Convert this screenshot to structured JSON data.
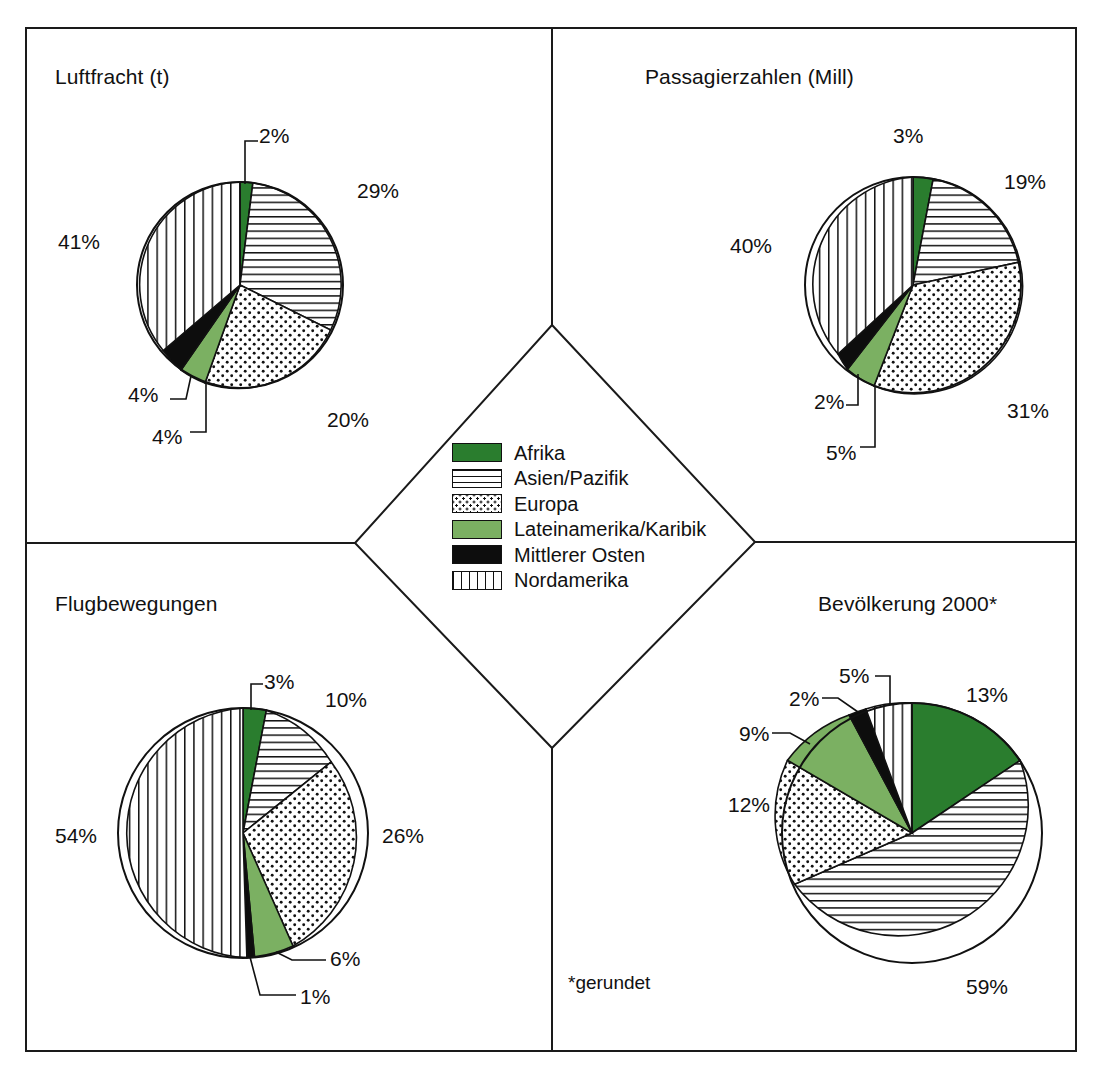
{
  "footnote": "*gerundet",
  "legend": {
    "items": [
      {
        "label": "Afrika",
        "pattern": "solid-dark-green",
        "color": "#2a7d2e"
      },
      {
        "label": "Asien/Pazifik",
        "pattern": "horizontal-lines",
        "color": "#ffffff"
      },
      {
        "label": "Europa",
        "pattern": "dots",
        "color": "#ffffff"
      },
      {
        "label": "Lateinamerika/Karibik",
        "pattern": "solid-light-green",
        "color": "#7bb062"
      },
      {
        "label": "Mittlerer Osten",
        "pattern": "solid-black",
        "color": "#0d0d0d"
      },
      {
        "label": "Nordamerika",
        "pattern": "vertical-lines",
        "color": "#ffffff"
      }
    ]
  },
  "chart_data": [
    {
      "id": "luftfracht",
      "type": "pie",
      "title": "Luftfracht (t)",
      "position": "top-left",
      "categories": [
        "Afrika",
        "Asien/Pazifik",
        "Europa",
        "Lateinamerika/Karibik",
        "Mittlerer Osten",
        "Nordamerika"
      ],
      "values": [
        2,
        29,
        20,
        4,
        4,
        41
      ],
      "labels": [
        "2%",
        "29%",
        "20%",
        "4%",
        "4%",
        "41%"
      ],
      "unit": "%",
      "start_angle_deg": 0,
      "direction": "clockwise",
      "center": [
        240,
        285
      ],
      "radius": 103,
      "label_positions": [
        {
          "text": "2%",
          "x": 259,
          "y": 124,
          "leader": true
        },
        {
          "text": "29%",
          "x": 357,
          "y": 179,
          "leader": false
        },
        {
          "text": "20%",
          "x": 327,
          "y": 408,
          "leader": false
        },
        {
          "text": "4%",
          "x": 152,
          "y": 425,
          "leader": true
        },
        {
          "text": "4%",
          "x": 128,
          "y": 383,
          "leader": true
        },
        {
          "text": "41%",
          "x": 58,
          "y": 230,
          "leader": false
        }
      ]
    },
    {
      "id": "passagierzahlen",
      "type": "pie",
      "title": "Passagierzahlen (Mill)",
      "position": "top-right",
      "categories": [
        "Afrika",
        "Asien/Pazifik",
        "Europa",
        "Lateinamerika/Karibik",
        "Mittlerer Osten",
        "Nordamerika"
      ],
      "values": [
        3,
        19,
        31,
        5,
        2,
        40
      ],
      "labels": [
        "3%",
        "19%",
        "31%",
        "5%",
        "2%",
        "40%"
      ],
      "unit": "%",
      "start_angle_deg": 0,
      "direction": "clockwise",
      "center": [
        913,
        285
      ],
      "radius": 108,
      "label_positions": [
        {
          "text": "3%",
          "x": 893,
          "y": 124,
          "leader": false
        },
        {
          "text": "19%",
          "x": 1004,
          "y": 170,
          "leader": false
        },
        {
          "text": "31%",
          "x": 1007,
          "y": 399,
          "leader": false
        },
        {
          "text": "5%",
          "x": 826,
          "y": 441,
          "leader": true
        },
        {
          "text": "2%",
          "x": 814,
          "y": 390,
          "leader": true
        },
        {
          "text": "40%",
          "x": 730,
          "y": 234,
          "leader": false
        }
      ]
    },
    {
      "id": "flugbewegungen",
      "type": "pie",
      "title": "Flugbewegungen",
      "position": "bottom-left",
      "categories": [
        "Afrika",
        "Asien/Pazifik",
        "Europa",
        "Lateinamerika/Karibik",
        "Mittlerer Osten",
        "Nordamerika"
      ],
      "values": [
        3,
        10,
        26,
        6,
        1,
        54
      ],
      "labels": [
        "3%",
        "10%",
        "26%",
        "6%",
        "1%",
        "54%"
      ],
      "unit": "%",
      "start_angle_deg": 0,
      "direction": "clockwise",
      "center": [
        243,
        833
      ],
      "radius": 125,
      "label_positions": [
        {
          "text": "3%",
          "x": 264,
          "y": 670,
          "leader": true
        },
        {
          "text": "10%",
          "x": 325,
          "y": 688,
          "leader": false
        },
        {
          "text": "26%",
          "x": 382,
          "y": 824,
          "leader": false
        },
        {
          "text": "6%",
          "x": 330,
          "y": 947,
          "leader": true
        },
        {
          "text": "1%",
          "x": 300,
          "y": 985,
          "leader": true
        },
        {
          "text": "54%",
          "x": 55,
          "y": 824,
          "leader": false
        }
      ]
    },
    {
      "id": "bevoelkerung",
      "type": "pie",
      "title": "Bevölkerung 2000*",
      "position": "bottom-right",
      "categories": [
        "Afrika",
        "Asien/Pazifik",
        "Europa",
        "Lateinamerika/Karibik",
        "Mittlerer Osten",
        "Nordamerika"
      ],
      "values": [
        13,
        59,
        12,
        9,
        2,
        5
      ],
      "labels": [
        "13%",
        "59%",
        "12%",
        "9%",
        "2%",
        "5%"
      ],
      "unit": "%",
      "start_angle_deg": 0,
      "direction": "clockwise",
      "center": [
        912,
        833
      ],
      "radius": 130,
      "label_positions": [
        {
          "text": "13%",
          "x": 966,
          "y": 683,
          "leader": false
        },
        {
          "text": "59%",
          "x": 966,
          "y": 975,
          "leader": false
        },
        {
          "text": "12%",
          "x": 728,
          "y": 793,
          "leader": false
        },
        {
          "text": "9%",
          "x": 739,
          "y": 722,
          "leader": true
        },
        {
          "text": "2%",
          "x": 789,
          "y": 687,
          "leader": true
        },
        {
          "text": "5%",
          "x": 839,
          "y": 664,
          "leader": true
        }
      ]
    }
  ]
}
